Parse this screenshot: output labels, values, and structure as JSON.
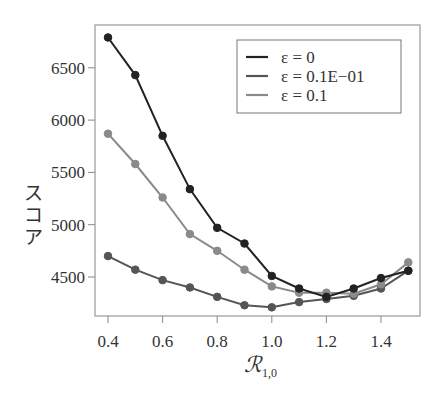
{
  "chart_data": {
    "type": "line",
    "title": "",
    "xlabel": "R_{1,0}",
    "xlabel_main": "ℛ",
    "xlabel_sub": "1,0",
    "ylabel": "スコア",
    "x": [
      0.4,
      0.5,
      0.6,
      0.7,
      0.8,
      0.9,
      1.0,
      1.1,
      1.2,
      1.3,
      1.4,
      1.5
    ],
    "series": [
      {
        "name": "ε = 0",
        "color": "#222222",
        "values": [
          6790,
          6430,
          5850,
          5340,
          4970,
          4820,
          4510,
          4390,
          4310,
          4390,
          4490,
          4560
        ]
      },
      {
        "name": "ε = 0.1E−01",
        "color": "#555555",
        "values": [
          4700,
          4570,
          4470,
          4400,
          4310,
          4230,
          4210,
          4260,
          4290,
          4320,
          4390,
          4560
        ]
      },
      {
        "name": "ε = 0.1",
        "color": "#8a8a8a",
        "values": [
          5870,
          5580,
          5260,
          4910,
          4750,
          4570,
          4410,
          4350,
          4350,
          4340,
          4430,
          4640
        ]
      }
    ],
    "xticks": [
      "0.4",
      "0.6",
      "0.8",
      "1.0",
      "1.2",
      "1.4"
    ],
    "yticks": [
      "4500",
      "5000",
      "5500",
      "6000",
      "6500"
    ],
    "xlim": [
      0.36,
      1.54
    ],
    "ylim": [
      4090,
      6920
    ],
    "grid": false,
    "legend_position": "upper right"
  }
}
